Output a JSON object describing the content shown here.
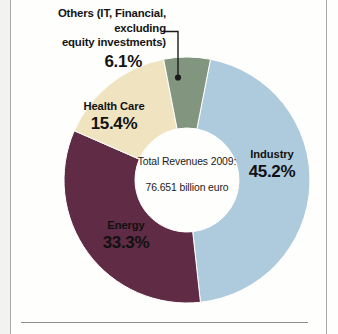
{
  "chart_data": {
    "type": "pie",
    "variant": "donut",
    "title": "",
    "center_label_line1": "Total Revenues 2009:",
    "center_label_line2": "76.651 billion euro",
    "total_value": 76.651,
    "total_unit": "billion euro",
    "year": "2009",
    "unit": "%",
    "categories": [
      "Industry",
      "Energy",
      "Health Care",
      "Others (IT, Financial, excluding equity investments)"
    ],
    "values": [
      45.2,
      33.3,
      15.4,
      6.1
    ],
    "colors": [
      "#aecbdd",
      "#5f2b45",
      "#f0e4c0",
      "#81957f"
    ],
    "legend": "none",
    "slices": [
      {
        "name": "Industry",
        "value": 45.2,
        "display": "45.2%",
        "color": "#aecbdd",
        "label_placement": "inside"
      },
      {
        "name": "Energy",
        "value": 33.3,
        "display": "33.3%",
        "color": "#5f2b45",
        "label_placement": "inside"
      },
      {
        "name": "Health Care",
        "value": 15.4,
        "display": "15.4%",
        "color": "#f0e4c0",
        "label_placement": "inside"
      },
      {
        "name": "Others (IT, Financial, excluding equity investments)",
        "value": 6.1,
        "display": "6.1%",
        "color": "#81957f",
        "label_placement": "callout"
      }
    ]
  },
  "callout": {
    "line1": "Others (IT, Financial, excluding",
    "line2": "equity investments)",
    "percent": "6.1%"
  },
  "labels": {
    "industry": {
      "name": "Industry",
      "percent": "45.2%"
    },
    "energy": {
      "name": "Energy",
      "percent": "33.3%"
    },
    "health_care": {
      "name": "Health Care",
      "percent": "15.4%"
    }
  },
  "center": {
    "line1": "Total Revenues 2009:",
    "line2": "76.651 billion euro"
  },
  "style": {
    "background": "#fefefd",
    "frame_line_color": "#a9a9a9",
    "text_color": "#111111"
  }
}
